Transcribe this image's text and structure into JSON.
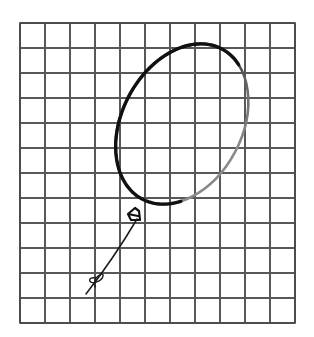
{
  "scene": {
    "title": "Hand-drawn balloon on graph paper",
    "background_color": "#ffffff",
    "width": 314,
    "height": 337
  },
  "grid": {
    "name": "graph-paper-grid",
    "origin_x": 20,
    "origin_y": 23,
    "cell_size": 25,
    "columns": 11,
    "rows": 12,
    "width": 275,
    "height": 300,
    "line_color": "#585858",
    "line_width": 1.2,
    "border_color": "#4a4a4a",
    "border_width": 1.6
  },
  "balloon": {
    "name": "balloon-body",
    "shape": "ellipse",
    "center_x": 182,
    "center_y": 124,
    "radius_x": 60,
    "radius_y": 85,
    "rotation_deg": 28,
    "stroke_dark_color": "#111111",
    "stroke_light_color": "#8a8a8a",
    "stroke_width_max": 3.4,
    "stroke_width_min": 2.0,
    "fill": "none",
    "top_point_y": 42,
    "bottom_point_y": 212,
    "left_point_x": 122,
    "right_point_x": 247
  },
  "knot": {
    "name": "balloon-knot",
    "x": 137,
    "y": 213,
    "width": 12,
    "height": 13,
    "stroke_color": "#111111",
    "stroke_width": 2.2
  },
  "string": {
    "name": "balloon-string",
    "start_x": 137,
    "start_y": 219,
    "end_x": 86,
    "end_y": 294,
    "stroke_color": "#1a1a1a",
    "stroke_width": 1.5
  },
  "bow": {
    "name": "string-bow",
    "center_x": 97,
    "center_y": 277,
    "loop_radius": 6,
    "stroke_color": "#1a1a1a",
    "stroke_width": 1.4
  }
}
